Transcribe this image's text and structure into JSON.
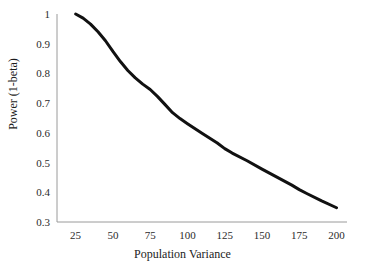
{
  "chart_data": {
    "type": "line",
    "title": "",
    "xlabel": "Population Variance",
    "ylabel": "Power (1-beta)",
    "xlim": [
      12.5,
      207
    ],
    "ylim": [
      0.3,
      1.0
    ],
    "grid": false,
    "legend": "none",
    "line_color": "#111111",
    "line_width_px": 3,
    "axis_color": "#9a9a9a",
    "xticks": [
      25,
      50,
      75,
      100,
      125,
      150,
      175,
      200
    ],
    "xtick_labels": [
      "25",
      "50",
      "75",
      "100",
      "125",
      "150",
      "175",
      "200"
    ],
    "yticks": [
      0.3,
      0.4,
      0.5,
      0.6,
      0.7,
      0.8,
      0.9,
      1.0
    ],
    "ytick_labels": [
      "0.3",
      "0.4",
      "0.5",
      "0.6",
      "0.7",
      "0.8",
      "0.9",
      "1"
    ],
    "series": [
      {
        "name": "power",
        "x": [
          25,
          30,
          35,
          40,
          45,
          50,
          55,
          60,
          65,
          70,
          75,
          80,
          85,
          90,
          95,
          100,
          110,
          120,
          125,
          130,
          140,
          150,
          160,
          170,
          175,
          180,
          190,
          200
        ],
        "values": [
          1.0,
          0.986,
          0.966,
          0.94,
          0.91,
          0.874,
          0.84,
          0.81,
          0.785,
          0.764,
          0.746,
          0.722,
          0.695,
          0.668,
          0.648,
          0.631,
          0.598,
          0.566,
          0.547,
          0.532,
          0.506,
          0.478,
          0.451,
          0.424,
          0.409,
          0.396,
          0.371,
          0.348
        ]
      }
    ]
  },
  "axis_title_x": "Population Variance",
  "axis_title_y": "Power (1-beta)"
}
